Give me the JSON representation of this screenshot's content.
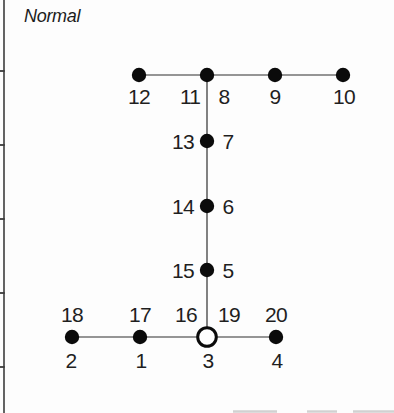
{
  "title": {
    "label": "Normal"
  },
  "canvas": {
    "width": 394,
    "height": 413,
    "background": "#fdfdfd"
  },
  "colors": {
    "axis": "#3d3d3d",
    "line": "#2f2f2f",
    "node_fill": "#0b0b0b",
    "open_node_fill": "#ffffff",
    "open_node_stroke": "#0b0b0b",
    "label": "#1f1f1f",
    "artifact": "#b5b5b5"
  },
  "axis": {
    "x": 4,
    "y1": 0,
    "y2": 413,
    "tick_length": 5,
    "tick_ys": [
      71,
      145,
      219,
      293,
      367
    ]
  },
  "graph": {
    "edges": [
      {
        "name": "top-arm-line",
        "x1": 139,
        "y1": 75,
        "x2": 343,
        "y2": 75
      },
      {
        "name": "center-line",
        "x1": 207,
        "y1": 75,
        "x2": 207,
        "y2": 337
      },
      {
        "name": "bottom-arm-line",
        "x1": 72,
        "y1": 337,
        "x2": 276,
        "y2": 337
      }
    ],
    "nodes": [
      {
        "x": 139,
        "y": 75,
        "type": "filled"
      },
      {
        "x": 207,
        "y": 75,
        "type": "filled"
      },
      {
        "x": 275,
        "y": 75,
        "type": "filled"
      },
      {
        "x": 343,
        "y": 75,
        "type": "filled"
      },
      {
        "x": 207,
        "y": 141,
        "type": "filled"
      },
      {
        "x": 207,
        "y": 206,
        "type": "filled"
      },
      {
        "x": 207,
        "y": 270,
        "type": "filled"
      },
      {
        "x": 72,
        "y": 337,
        "type": "filled"
      },
      {
        "x": 140,
        "y": 337,
        "type": "filled"
      },
      {
        "x": 207,
        "y": 337,
        "type": "open"
      },
      {
        "x": 276,
        "y": 337,
        "type": "filled"
      }
    ],
    "node_radius": 7.2,
    "open_node_radius": 9.3,
    "open_node_stroke_width": 3,
    "labels": [
      {
        "text": "12",
        "x": 139,
        "y": 96
      },
      {
        "text": "11",
        "x": 190,
        "y": 96
      },
      {
        "text": "8",
        "x": 224,
        "y": 96
      },
      {
        "text": "9",
        "x": 275,
        "y": 96
      },
      {
        "text": "10",
        "x": 344,
        "y": 96
      },
      {
        "text": "13",
        "x": 183,
        "y": 141
      },
      {
        "text": "7",
        "x": 228,
        "y": 141
      },
      {
        "text": "14",
        "x": 183,
        "y": 206
      },
      {
        "text": "6",
        "x": 228,
        "y": 206
      },
      {
        "text": "15",
        "x": 183,
        "y": 270
      },
      {
        "text": "5",
        "x": 228,
        "y": 270
      },
      {
        "text": "18",
        "x": 72,
        "y": 314
      },
      {
        "text": "17",
        "x": 140,
        "y": 314
      },
      {
        "text": "16",
        "x": 186,
        "y": 314
      },
      {
        "text": "19",
        "x": 229,
        "y": 314
      },
      {
        "text": "20",
        "x": 276,
        "y": 314
      },
      {
        "text": "2",
        "x": 71,
        "y": 360
      },
      {
        "text": "1",
        "x": 141,
        "y": 360
      },
      {
        "text": "3",
        "x": 208,
        "y": 360
      },
      {
        "text": "4",
        "x": 277,
        "y": 360
      }
    ]
  },
  "artifacts": [
    {
      "x1": 233,
      "x2": 277,
      "y": 411.5
    },
    {
      "x1": 307,
      "x2": 337,
      "y": 411.5
    },
    {
      "x1": 353,
      "x2": 394,
      "y": 411.5
    }
  ]
}
